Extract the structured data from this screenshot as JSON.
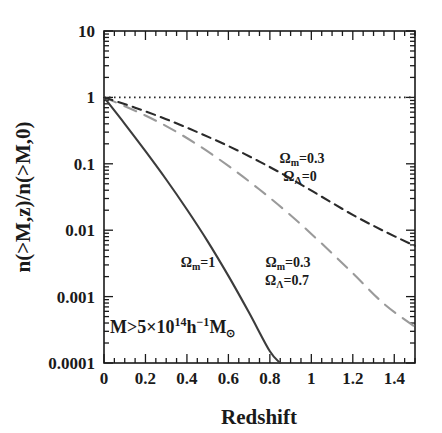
{
  "chart_data": {
    "type": "line",
    "title": "",
    "xlabel": "Redshift",
    "ylabel": "n(>M,z)/n(>M,0)",
    "xlim": [
      0,
      1.5
    ],
    "ylim": [
      0.0001,
      10
    ],
    "yscale": "log",
    "xscale": "linear",
    "grid": false,
    "legend_position": "inline-annotations",
    "xticks": [
      0,
      0.2,
      0.4,
      0.6,
      0.8,
      1,
      1.2,
      1.4
    ],
    "xtick_labels": [
      "0",
      "0.2",
      "0.4",
      "0.6",
      "0.8",
      "1",
      "1.2",
      "1.4"
    ],
    "xminor_step": 0.05,
    "yticks": [
      10,
      1,
      0.1,
      0.01,
      0.001,
      0.0001
    ],
    "ytick_labels": [
      "10",
      "1",
      "0.1",
      "0.01",
      "0.001",
      "0.0001"
    ],
    "series": [
      {
        "name": "Omega_m=1",
        "style": "solid",
        "color": "#3c3c3c",
        "x": [
          0.0,
          0.1,
          0.2,
          0.3,
          0.4,
          0.5,
          0.6,
          0.7,
          0.8,
          0.85
        ],
        "values": [
          1.0,
          0.4,
          0.155,
          0.058,
          0.0205,
          0.0068,
          0.00205,
          0.00057,
          0.00015,
          0.0001
        ]
      },
      {
        "name": "Omega_m=0.3, Omega_Lambda=0.7",
        "style": "long-dash",
        "color": "#9a9a9a",
        "x": [
          0.0,
          0.15,
          0.3,
          0.45,
          0.6,
          0.75,
          0.9,
          1.05,
          1.2,
          1.35,
          1.5
        ],
        "values": [
          1.0,
          0.63,
          0.37,
          0.195,
          0.093,
          0.041,
          0.0168,
          0.0063,
          0.00225,
          0.00078,
          0.00035
        ]
      },
      {
        "name": "Omega_m=0.3, Omega_Lambda=0",
        "style": "short-dash",
        "color": "#2a2a2a",
        "x": [
          0.0,
          0.15,
          0.3,
          0.45,
          0.6,
          0.75,
          0.9,
          1.05,
          1.2,
          1.35,
          1.5
        ],
        "values": [
          1.0,
          0.7,
          0.47,
          0.3,
          0.185,
          0.108,
          0.06,
          0.032,
          0.017,
          0.0097,
          0.0058
        ]
      },
      {
        "name": "reference-unity",
        "style": "dotted",
        "color": "#2a2a2a",
        "x": [
          0.0,
          1.5
        ],
        "values": [
          1.0,
          1.0
        ]
      }
    ],
    "annotations": [
      {
        "id": "curve-label-open",
        "omega_m": "Ω",
        "omega_m_sub": "m",
        "omega_m_value": "=0.3",
        "omega_l": "Ω",
        "omega_l_sub": "Λ",
        "omega_l_value": "=0",
        "x": 0.98,
        "y": 0.105
      },
      {
        "id": "curve-label-lambda",
        "omega_m": "Ω",
        "omega_m_sub": "m",
        "omega_m_value": "=0.3",
        "omega_l": "Ω",
        "omega_l_sub": "Λ",
        "omega_l_value": "=0.7",
        "x": 0.86,
        "y": 0.0043
      },
      {
        "id": "curve-label-einstein",
        "omega_m": "Ω",
        "omega_m_sub": "m",
        "omega_m_value": "=1",
        "x": 0.34,
        "y": 0.0043
      }
    ],
    "mass_annotation": {
      "prefix": "M>5×10",
      "exponent": "14",
      "h": "h",
      "h_exponent": "−1",
      "mass_symbol": "M",
      "mass_sub": "⊙"
    }
  }
}
